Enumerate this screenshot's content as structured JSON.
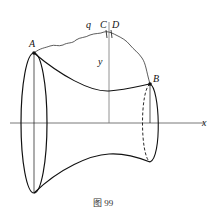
{
  "figure": {
    "caption": "图 99",
    "labels": {
      "point_a": "A",
      "point_b": "B",
      "point_c": "C",
      "point_d": "D",
      "curve_q": "q",
      "axis_y": "y",
      "axis_x": "x"
    },
    "colors": {
      "stroke": "#111111",
      "axis": "#555555"
    }
  }
}
